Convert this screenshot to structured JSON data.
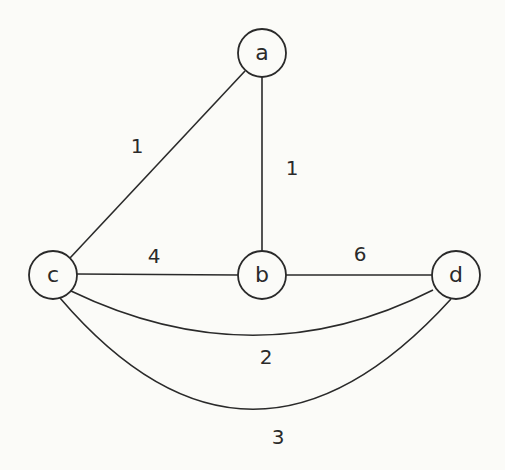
{
  "diagram": {
    "type": "weighted-undirected-multigraph",
    "nodes": [
      {
        "id": "a",
        "label": "a",
        "x": 262,
        "y": 53,
        "r": 24
      },
      {
        "id": "b",
        "label": "b",
        "x": 262,
        "y": 275,
        "r": 24
      },
      {
        "id": "c",
        "label": "c",
        "x": 53,
        "y": 275,
        "r": 24
      },
      {
        "id": "d",
        "label": "d",
        "x": 456,
        "y": 275,
        "r": 24
      }
    ],
    "edges": [
      {
        "from": "a",
        "to": "c",
        "weight": "1",
        "path": "M245 71 L70 258",
        "label_x": 137,
        "label_y": 146
      },
      {
        "from": "a",
        "to": "b",
        "weight": "1",
        "path": "M262 77 L262 251",
        "label_x": 292,
        "label_y": 168
      },
      {
        "from": "c",
        "to": "b",
        "weight": "4",
        "path": "M77 274 L238 275",
        "label_x": 154,
        "label_y": 256
      },
      {
        "from": "b",
        "to": "d",
        "weight": "6",
        "path": "M286 275 L432 275",
        "label_x": 360,
        "label_y": 254
      },
      {
        "from": "c",
        "to": "d",
        "weight": "2",
        "path": "M71 291 Q256 380 433 290",
        "label_x": 266,
        "label_y": 357
      },
      {
        "from": "c",
        "to": "d",
        "weight": "3",
        "path": "M60 298 Q250 520 451 299",
        "label_x": 278,
        "label_y": 437
      }
    ]
  }
}
